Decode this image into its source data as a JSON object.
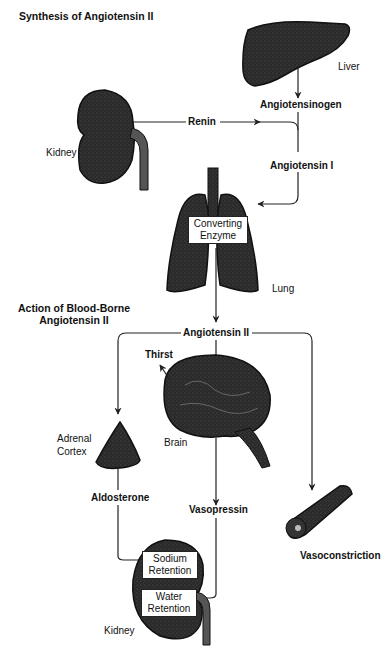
{
  "headings": {
    "synthesis": "Synthesis of Angiotensin II",
    "action_line1": "Action of Blood-Borne",
    "action_line2": "Angiotensin II"
  },
  "organs": {
    "liver": "Liver",
    "kidney_top": "Kidney",
    "lung": "Lung",
    "brain": "Brain",
    "adrenal_line1": "Adrenal",
    "adrenal_line2": "Cortex",
    "kidney_bottom": "Kidney"
  },
  "substances": {
    "angiotensinogen": "Angiotensinogen",
    "renin": "Renin",
    "angiotensin_1": "Angiotensin I",
    "angiotensin_2": "Angiotensin II",
    "aldosterone": "Aldosterone",
    "vasopressin": "Vasopressin"
  },
  "boxes": {
    "converting_line1": "Converting",
    "converting_line2": "Enzyme",
    "sodium_line1": "Sodium",
    "sodium_line2": "Retention",
    "water_line1": "Water",
    "water_line2": "Retention"
  },
  "effects": {
    "thirst": "Thirst",
    "vasoconstriction": "Vasoconstriction"
  },
  "colors": {
    "organ_fill": "#2a2a2a",
    "line": "#222222",
    "background": "#ffffff"
  }
}
